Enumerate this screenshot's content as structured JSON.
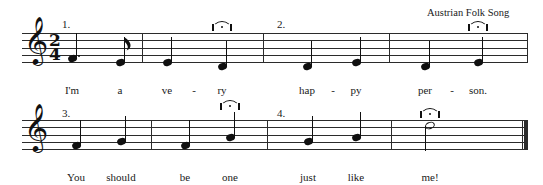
{
  "document": {
    "title": "I'm A Very Happy Person",
    "credit": "Austrian Folk Song",
    "clef": "treble-clef",
    "clef_glyph": "𝄞",
    "time_signature": {
      "numerator": "2",
      "denominator": "4"
    },
    "ink_color": "#101010",
    "staff_color": "#2b2b2b",
    "paper_color": "#ffffff"
  },
  "systems": [
    {
      "id": "system-1",
      "phrase_numbers": [
        {
          "label": "1.",
          "x": 62,
          "y": 18
        },
        {
          "label": "2.",
          "x": 277,
          "y": 18
        }
      ],
      "measures": [
        {
          "id": "measure-1",
          "notes": [
            {
              "id": "n1",
              "lyric": "I'm",
              "pitch": "D4",
              "duration": "dotted-quarter",
              "stem": "up",
              "dotted": true,
              "head": "filled",
              "x": 72,
              "y": 58,
              "fermata": false
            },
            {
              "id": "n2",
              "lyric": "a",
              "pitch": "C4",
              "duration": "eighth",
              "stem": "up",
              "dotted": false,
              "head": "filled",
              "x": 120,
              "y": 62,
              "fermata": false
            }
          ]
        },
        {
          "id": "measure-2",
          "notes": [
            {
              "id": "n3",
              "lyric": "ve",
              "pitch": "C4",
              "duration": "quarter",
              "stem": "up",
              "dotted": false,
              "head": "filled",
              "x": 167,
              "y": 62,
              "fermata": false
            },
            {
              "id": "n4",
              "lyric": "ry",
              "pitch": "B3",
              "duration": "quarter",
              "stem": "up",
              "dotted": false,
              "head": "filled",
              "x": 222,
              "y": 66,
              "fermata": true
            }
          ]
        },
        {
          "id": "measure-3",
          "notes": [
            {
              "id": "n5",
              "lyric": "hap",
              "pitch": "B3",
              "duration": "quarter",
              "stem": "up",
              "dotted": false,
              "head": "filled",
              "x": 307,
              "y": 66,
              "fermata": false
            },
            {
              "id": "n6",
              "lyric": "py",
              "pitch": "C4",
              "duration": "quarter",
              "stem": "up",
              "dotted": false,
              "head": "filled",
              "x": 356,
              "y": 62,
              "fermata": false
            }
          ]
        },
        {
          "id": "measure-4",
          "notes": [
            {
              "id": "n7",
              "lyric": "per",
              "pitch": "B3",
              "duration": "quarter",
              "stem": "up",
              "dotted": false,
              "head": "filled",
              "x": 425,
              "y": 66,
              "fermata": false
            },
            {
              "id": "n8",
              "lyric": "son.",
              "pitch": "C4",
              "duration": "quarter",
              "stem": "up",
              "dotted": false,
              "head": "filled",
              "x": 478,
              "y": 62,
              "fermata": true
            }
          ]
        }
      ],
      "lyric_hyphens": [
        {
          "x": 194,
          "y": 84
        },
        {
          "x": 333,
          "y": 84
        },
        {
          "x": 452,
          "y": 84
        }
      ]
    },
    {
      "id": "system-2",
      "phrase_numbers": [
        {
          "label": "3.",
          "x": 62,
          "y": 107
        },
        {
          "label": "4.",
          "x": 277,
          "y": 107
        }
      ],
      "measures": [
        {
          "id": "measure-5",
          "notes": [
            {
              "id": "n9",
              "lyric": "You",
              "pitch": "B3",
              "duration": "quarter",
              "stem": "up",
              "dotted": false,
              "head": "filled",
              "x": 76,
              "y": 145,
              "fermata": false
            },
            {
              "id": "n10",
              "lyric": "should",
              "pitch": "C4",
              "duration": "quarter",
              "stem": "up",
              "dotted": false,
              "head": "filled",
              "x": 121,
              "y": 141,
              "fermata": false
            }
          ]
        },
        {
          "id": "measure-6",
          "notes": [
            {
              "id": "n11",
              "lyric": "be",
              "pitch": "B3",
              "duration": "quarter",
              "stem": "up",
              "dotted": false,
              "head": "filled",
              "x": 185,
              "y": 145,
              "fermata": false
            },
            {
              "id": "n12",
              "lyric": "one",
              "pitch": "D4",
              "duration": "quarter",
              "stem": "up",
              "dotted": false,
              "head": "filled",
              "x": 230,
              "y": 137,
              "fermata": true
            }
          ]
        },
        {
          "id": "measure-7",
          "notes": [
            {
              "id": "n13",
              "lyric": "just",
              "pitch": "C4",
              "duration": "quarter",
              "stem": "up",
              "dotted": false,
              "head": "filled",
              "x": 308,
              "y": 141,
              "fermata": false
            },
            {
              "id": "n14",
              "lyric": "like",
              "pitch": "D4",
              "duration": "quarter",
              "stem": "up",
              "dotted": false,
              "head": "filled",
              "x": 356,
              "y": 137,
              "fermata": false
            }
          ]
        },
        {
          "id": "measure-8",
          "notes": [
            {
              "id": "n15",
              "lyric": "me!",
              "pitch": "G4",
              "duration": "half",
              "stem": "down",
              "dotted": false,
              "head": "hollow",
              "x": 430,
              "y": 126,
              "fermata": true
            }
          ]
        }
      ],
      "lyric_hyphens": []
    }
  ],
  "staves": [
    {
      "id": "staff-1",
      "x": 22,
      "y": 33,
      "width": 506,
      "line_gap": 7.3
    },
    {
      "id": "staff-2",
      "x": 22,
      "y": 120,
      "width": 506,
      "line_gap": 7.3
    }
  ],
  "lyrics_baseline": {
    "system1_y": 84,
    "system2_y": 171
  }
}
